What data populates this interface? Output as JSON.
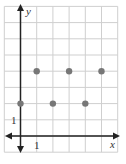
{
  "chart_data": {
    "type": "scatter",
    "title": "",
    "xlabel": "x",
    "ylabel": "y",
    "x_tick_label": "1",
    "y_tick_label": "1",
    "xlim": [
      -1,
      6
    ],
    "ylim": [
      -1,
      8
    ],
    "grid": true,
    "legend": null,
    "points": [
      {
        "x": 1,
        "y": 4
      },
      {
        "x": 3,
        "y": 4
      },
      {
        "x": 5,
        "y": 4
      },
      {
        "x": 0,
        "y": 2
      },
      {
        "x": 2,
        "y": 2
      },
      {
        "x": 4,
        "y": 2
      }
    ],
    "colors": {
      "grid": "#cfcfcf",
      "axis": "#222222",
      "point": "#777777"
    }
  }
}
